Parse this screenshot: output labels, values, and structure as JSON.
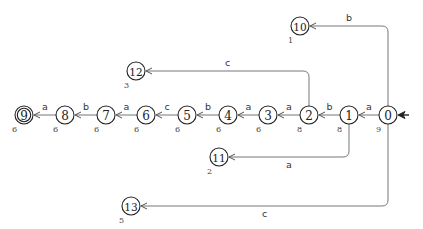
{
  "diagram": {
    "type": "finite-state-automaton",
    "start_state": "0",
    "states": [
      {
        "id": "0",
        "label": "0",
        "count": "9",
        "x": 388,
        "y": 115,
        "accepting": false
      },
      {
        "id": "1",
        "label": "1",
        "count": "8",
        "x": 349,
        "y": 115,
        "accepting": false
      },
      {
        "id": "2",
        "label": "2",
        "count": "8",
        "x": 309,
        "y": 115,
        "accepting": false
      },
      {
        "id": "3",
        "label": "3",
        "count": "6",
        "x": 268,
        "y": 115,
        "accepting": false
      },
      {
        "id": "4",
        "label": "4",
        "count": "6",
        "x": 228,
        "y": 115,
        "accepting": false
      },
      {
        "id": "5",
        "label": "5",
        "count": "6",
        "x": 187,
        "y": 115,
        "accepting": false
      },
      {
        "id": "6",
        "label": "6",
        "count": "6",
        "x": 146,
        "y": 115,
        "accepting": false
      },
      {
        "id": "7",
        "label": "7",
        "count": "6",
        "x": 106,
        "y": 115,
        "accepting": false
      },
      {
        "id": "8",
        "label": "8",
        "count": "6",
        "x": 65,
        "y": 115,
        "accepting": false
      },
      {
        "id": "9",
        "label": "9",
        "count": "6",
        "x": 24,
        "y": 115,
        "accepting": true
      },
      {
        "id": "10",
        "label": "10",
        "count": "1",
        "x": 300,
        "y": 26,
        "accepting": false
      },
      {
        "id": "11",
        "label": "11",
        "count": "2",
        "x": 219,
        "y": 157,
        "accepting": false
      },
      {
        "id": "12",
        "label": "12",
        "count": "3",
        "x": 136,
        "y": 71,
        "accepting": false
      },
      {
        "id": "13",
        "label": "13",
        "count": "5",
        "x": 131,
        "y": 206,
        "accepting": false
      }
    ],
    "edges": [
      {
        "from": "0",
        "to": "1",
        "label": "a"
      },
      {
        "from": "1",
        "to": "2",
        "label": "b"
      },
      {
        "from": "2",
        "to": "3",
        "label": "a"
      },
      {
        "from": "3",
        "to": "4",
        "label": "a"
      },
      {
        "from": "4",
        "to": "5",
        "label": "b"
      },
      {
        "from": "5",
        "to": "6",
        "label": "c"
      },
      {
        "from": "6",
        "to": "7",
        "label": "a"
      },
      {
        "from": "7",
        "to": "8",
        "label": "b"
      },
      {
        "from": "8",
        "to": "9",
        "label": "a"
      },
      {
        "from": "0",
        "to": "10",
        "label": "b"
      },
      {
        "from": "2",
        "to": "12",
        "label": "c"
      },
      {
        "from": "1",
        "to": "11",
        "label": "a"
      },
      {
        "from": "0",
        "to": "13",
        "label": "c"
      }
    ]
  }
}
